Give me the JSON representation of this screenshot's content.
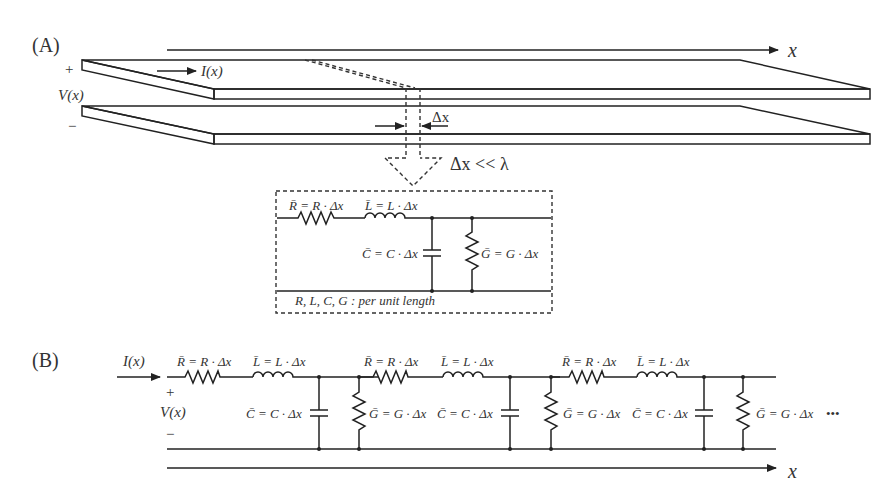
{
  "figure": {
    "panel_a": {
      "label": "(A)",
      "axis_label": "x",
      "current_label": "I(x)",
      "voltage_label": "V(x)",
      "plus": "+",
      "minus": "−",
      "dx_label": "Δx",
      "approx_condition": "Δx << λ",
      "inset": {
        "r_label": "R̄ = R · Δx",
        "l_label": "L̄ = L · Δx",
        "c_label": "C̄ = C · Δx",
        "g_label": "Ḡ = G · Δx",
        "note": "R, L, C, G : per unit length"
      }
    },
    "panel_b": {
      "label": "(B)",
      "current_label": "I(x)",
      "voltage_label": "V(x)",
      "plus": "+",
      "minus": "−",
      "axis_label": "x",
      "continuation": "•••",
      "sections": [
        {
          "r_label": "R̄ = R · Δx",
          "l_label": "L̄ = L · Δx",
          "c_label": "C̄ = C · Δx",
          "g_label": "Ḡ = G · Δx"
        },
        {
          "r_label": "R̄ = R · Δx",
          "l_label": "L̄ = L · Δx",
          "c_label": "C̄ = C · Δx",
          "g_label": "Ḡ = G · Δx"
        },
        {
          "r_label": "R̄ = R · Δx",
          "l_label": "L̄ = L · Δx",
          "c_label": "C̄ = C · Δx",
          "g_label": "Ḡ = G · Δx"
        }
      ]
    }
  }
}
